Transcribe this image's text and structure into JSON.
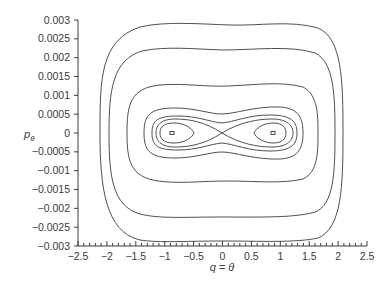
{
  "chart_data": {
    "type": "line",
    "subtype": "phase-portrait-contours",
    "title": "",
    "xlabel": "q = θ",
    "ylabel": "pθ",
    "xlim": [
      -2.5,
      2.5
    ],
    "ylim": [
      -0.003,
      0.003
    ],
    "grid": false,
    "legend": null,
    "x_ticks": [
      -2.5,
      -2,
      -1.5,
      -1,
      -0.5,
      0,
      0.5,
      1,
      1.5,
      2,
      2.5
    ],
    "x_tick_labels": [
      "−2.5",
      "−2",
      "−1.5",
      "−1",
      "−0.5",
      "0",
      "0.5",
      "1",
      "1.5",
      "2",
      "2.5"
    ],
    "y_ticks": [
      0.003,
      0.0025,
      0.002,
      0.0015,
      0.001,
      0.0005,
      0,
      -0.0005,
      -0.001,
      -0.0015,
      -0.002,
      -0.0025,
      -0.003
    ],
    "y_tick_labels": [
      "0.003",
      "0.0025",
      "0.002",
      "0.0015",
      "0.001",
      "0.0005",
      "0",
      "−0.0005",
      "−0.001",
      "−0.0015",
      "−0.002",
      "−0.0025",
      "−0.003"
    ],
    "series": [
      {
        "name": "orbit-1 (outermost)",
        "q_range": [
          -1.97,
          2.1
        ],
        "p_range": [
          -0.00287,
          0.0029
        ]
      },
      {
        "name": "orbit-2",
        "q_range": [
          -1.82,
          1.96
        ],
        "p_range": [
          -0.00224,
          0.00223
        ]
      },
      {
        "name": "orbit-3",
        "q_range": [
          -1.5,
          1.65
        ],
        "p_range": [
          -0.0013,
          0.0013
        ]
      },
      {
        "name": "orbit-4 (peanut)",
        "q_range": [
          -1.2,
          1.4
        ],
        "p_range": [
          -0.00066,
          0.00066
        ]
      },
      {
        "name": "separatrix (figure-8)",
        "q_range": [
          -1.15,
          1.3
        ],
        "p_range": [
          -0.00045,
          0.0004
        ],
        "crossing": [
          0,
          0
        ]
      },
      {
        "name": "island-left",
        "q_range": [
          -1.03,
          -0.45
        ],
        "p_range": [
          -0.00027,
          0.00027
        ]
      },
      {
        "name": "island-right",
        "q_range": [
          0.6,
          1.1
        ],
        "p_range": [
          -0.00025,
          0.00025
        ]
      },
      {
        "name": "fixed-point-left",
        "q": -0.85,
        "p": 0
      },
      {
        "name": "fixed-point-right",
        "q": 0.88,
        "p": 0
      }
    ]
  }
}
